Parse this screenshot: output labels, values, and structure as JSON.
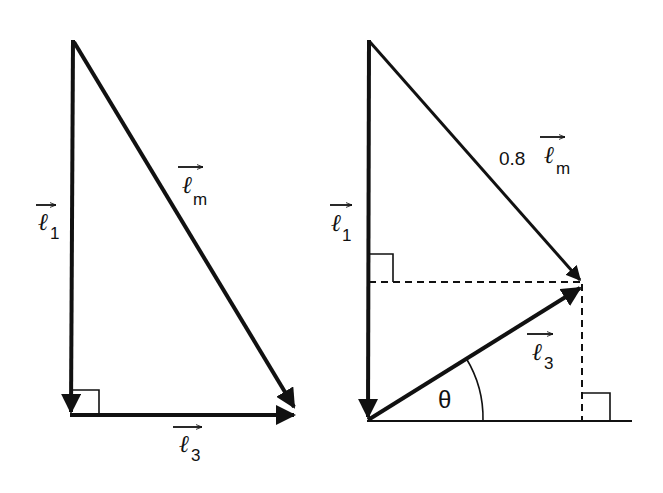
{
  "diagram": {
    "type": "vector-triangle-diagram",
    "panels": [
      {
        "id": "left",
        "vectors": [
          {
            "name": "l1",
            "symbol": "ℓ",
            "subscript": "1",
            "direction": "down"
          },
          {
            "name": "lm",
            "symbol": "ℓ",
            "subscript": "m",
            "direction": "diagonal-down-right"
          },
          {
            "name": "l3",
            "symbol": "ℓ",
            "subscript": "3",
            "direction": "right"
          }
        ],
        "right_angle_markers": 1
      },
      {
        "id": "right",
        "vectors": [
          {
            "name": "l1",
            "symbol": "ℓ",
            "subscript": "1",
            "direction": "down"
          },
          {
            "name": "0.8lm",
            "coefficient": "0.8",
            "symbol": "ℓ",
            "subscript": "m",
            "direction": "diagonal-down-right"
          },
          {
            "name": "l3",
            "symbol": "ℓ",
            "subscript": "3",
            "direction": "diagonal-up-right"
          }
        ],
        "angle_label": "θ",
        "right_angle_markers": 2,
        "dashed_projections": 2
      }
    ]
  },
  "labels": {
    "left": {
      "l1_symbol": "ℓ",
      "l1_sub": "1",
      "lm_symbol": "ℓ",
      "lm_sub": "m",
      "l3_symbol": "ℓ",
      "l3_sub": "3"
    },
    "right": {
      "l1_symbol": "ℓ",
      "l1_sub": "1",
      "lm_coef": "0.8",
      "lm_symbol": "ℓ",
      "lm_sub": "m",
      "l3_symbol": "ℓ",
      "l3_sub": "3",
      "theta": "θ"
    }
  },
  "colors": {
    "stroke": "#111111",
    "background": "#ffffff"
  }
}
